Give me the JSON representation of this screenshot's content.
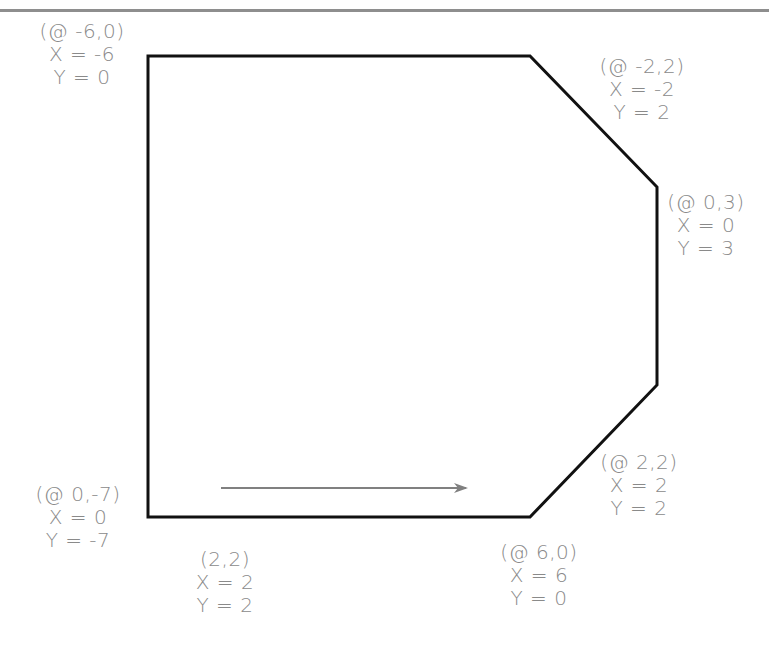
{
  "diagram": {
    "colors": {
      "outline": "#111111",
      "label": "#8a8a8a",
      "arrow": "#808080",
      "top_rule": "#8e8e8e"
    },
    "start_point": {
      "coord": "(2,2)",
      "x_line": "X = 2",
      "y_line": "Y = 2"
    },
    "direction_arrow": "drawing direction",
    "vertices": [
      {
        "id": "v1",
        "coord": "(@ 6,0)",
        "x_line": "X = 6",
        "y_line": "Y = 0"
      },
      {
        "id": "v2",
        "coord": "(@ 2,2)",
        "x_line": "X = 2",
        "y_line": "Y = 2"
      },
      {
        "id": "v3",
        "coord": "(@ 0,3)",
        "x_line": "X = 0",
        "y_line": "Y = 3"
      },
      {
        "id": "v4",
        "coord": "(@ -2,2)",
        "x_line": "X = -2",
        "y_line": "Y = 2"
      },
      {
        "id": "v5",
        "coord": "(@ -6,0)",
        "x_line": "X = -6",
        "y_line": "Y = 0"
      },
      {
        "id": "v6",
        "coord": "(@ 0,-7)",
        "x_line": "X = 0",
        "y_line": "Y = -7"
      }
    ]
  }
}
